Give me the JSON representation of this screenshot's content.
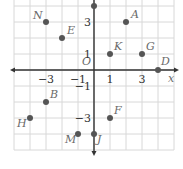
{
  "grid": {
    "origin_px": [
      94,
      70
    ],
    "unit_px": 16,
    "x_range": [
      -5,
      5
    ],
    "y_range": [
      -5,
      4
    ],
    "grid_color": "#d8d8d8",
    "axis_color": "#333333",
    "point_color": "#555555"
  },
  "axes": {
    "x_label": "x",
    "origin_label": "O",
    "x_ticks": [
      {
        "value": -3,
        "label": "−3"
      },
      {
        "value": -1,
        "label": "−1"
      },
      {
        "value": 1,
        "label": "1"
      },
      {
        "value": 3,
        "label": "3"
      }
    ],
    "y_ticks": [
      {
        "value": 3,
        "label": "3"
      },
      {
        "value": 1,
        "label": "1"
      },
      {
        "value": -1,
        "label": "−1"
      },
      {
        "value": -3,
        "label": "−3"
      }
    ]
  },
  "points": [
    {
      "name": "N",
      "x": -3,
      "y": 3
    },
    {
      "name": "E",
      "x": -2,
      "y": 2
    },
    {
      "name": "A",
      "x": 2,
      "y": 3
    },
    {
      "name": "K",
      "x": 1,
      "y": 1
    },
    {
      "name": "G",
      "x": 3,
      "y": 1
    },
    {
      "name": "D",
      "x": 4,
      "y": 0
    },
    {
      "name": "B",
      "x": -3,
      "y": -2
    },
    {
      "name": "H",
      "x": -4,
      "y": -3
    },
    {
      "name": "F",
      "x": 1,
      "y": -3
    },
    {
      "name": "M",
      "x": -1,
      "y": -4
    },
    {
      "name": "J",
      "x": 0,
      "y": -4
    },
    {
      "name": "",
      "x": 0,
      "y": 4
    }
  ]
}
